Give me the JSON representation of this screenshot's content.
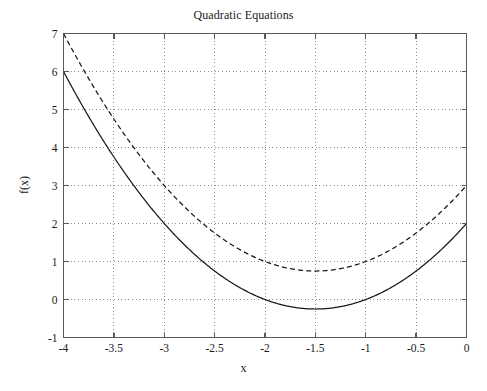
{
  "chart_data": {
    "type": "line",
    "title": "Quadratic Equations",
    "xlabel": "x",
    "ylabel": "f(x)",
    "xlim": [
      -4,
      0
    ],
    "ylim": [
      -1,
      7
    ],
    "xticks": [
      -4,
      -3.5,
      -3,
      -2.5,
      -2,
      -1.5,
      -1,
      -0.5,
      0
    ],
    "xticklabels": [
      "-4",
      "-3.5",
      "-3",
      "-2.5",
      "-2",
      "-1.5",
      "-1",
      "-0.5",
      "0"
    ],
    "yticks": [
      -1,
      0,
      1,
      2,
      3,
      4,
      5,
      6,
      7
    ],
    "yticklabels": [
      "-1",
      "0",
      "1",
      "2",
      "3",
      "4",
      "5",
      "6",
      "7"
    ],
    "grid": true,
    "grid_style": "dotted",
    "grid_color": "#8c8c8c",
    "axis_color": "#595959",
    "legend": null,
    "series": [
      {
        "name": "f(x) = x^2 + 3x + 2",
        "style": "solid",
        "color": "#1a1a1a",
        "coefficients": {
          "a": 1,
          "b": 3,
          "c": 2
        },
        "vertex": [
          -1.5,
          -0.25
        ],
        "x": [
          -4,
          -3.75,
          -3.5,
          -3.25,
          -3,
          -2.75,
          -2.5,
          -2.25,
          -2,
          -1.75,
          -1.5,
          -1.25,
          -1,
          -0.75,
          -0.5,
          -0.25,
          0
        ],
        "values": [
          6,
          4.8125,
          3.75,
          2.8125,
          2,
          1.3125,
          0.75,
          0.3125,
          0,
          -0.1875,
          -0.25,
          -0.1875,
          0,
          0.3125,
          0.75,
          1.3125,
          2
        ]
      },
      {
        "name": "f(x) = x^2 + 3x + 3",
        "style": "dashed",
        "color": "#1a1a1a",
        "coefficients": {
          "a": 1,
          "b": 3,
          "c": 3
        },
        "vertex": [
          -1.5,
          0.75
        ],
        "x": [
          -4,
          -3.75,
          -3.5,
          -3.25,
          -3,
          -2.75,
          -2.5,
          -2.25,
          -2,
          -1.75,
          -1.5,
          -1.25,
          -1,
          -0.75,
          -0.5,
          -0.25,
          0
        ],
        "values": [
          7,
          5.8125,
          4.75,
          3.8125,
          3,
          2.3125,
          1.75,
          1.3125,
          1,
          0.8125,
          0.75,
          0.8125,
          1,
          1.3125,
          1.75,
          2.3125,
          3
        ]
      }
    ]
  }
}
